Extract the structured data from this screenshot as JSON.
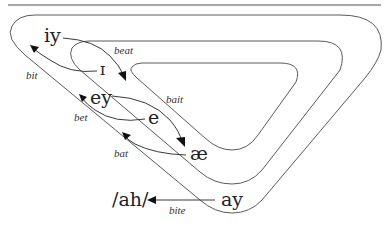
{
  "diagram": {
    "vowels": {
      "iy": "iy",
      "ih": "ɪ",
      "ey": "ey",
      "eh": "e",
      "ae": "æ",
      "ah": "/ah/",
      "ay": "ay"
    },
    "words": {
      "beat": "beat",
      "bit": "bit",
      "bait": "bait",
      "bet": "bet",
      "bat": "bat",
      "bite": "bite"
    },
    "loops": [
      {
        "name": "outer-loop"
      },
      {
        "name": "middle-loop"
      },
      {
        "name": "inner-loop"
      }
    ],
    "arrows": [
      {
        "from": "iy",
        "to": "ɪ-region",
        "label": "beat"
      },
      {
        "from": "ɪ",
        "to": "iy-region",
        "label": "bit"
      },
      {
        "from": "ey",
        "to": "e-region",
        "label": "bait"
      },
      {
        "from": "e",
        "to": "ey-region",
        "label": "bet"
      },
      {
        "from": "æ",
        "to": "e-region",
        "label": "bat"
      },
      {
        "from": "ay",
        "to": "/ah/",
        "label": "bite"
      }
    ],
    "colors": {
      "line": "#5a5a5a",
      "rule": "#8a8a8a",
      "text": "#222222"
    }
  }
}
